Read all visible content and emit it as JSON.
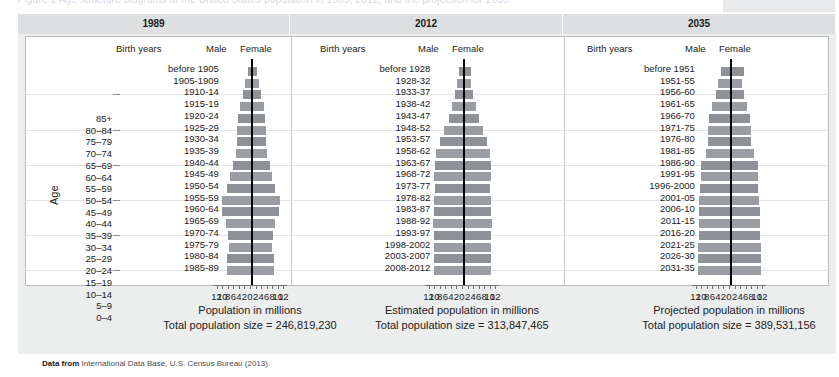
{
  "top_strip": {
    "faded_caption": "Figure 1  Age structure diagrams of the United States population in 1989, 2012, and the projection for 2035."
  },
  "figure": {
    "y_axis_label": "Age",
    "age_groups": [
      "85+",
      "80–84",
      "75–79",
      "70–74",
      "65–69",
      "60–64",
      "55–59",
      "50–54",
      "45–49",
      "40–44",
      "35–39",
      "30–34",
      "25–29",
      "20–24",
      "15–19",
      "10–14",
      "5–9",
      "0–4"
    ],
    "column_headers": {
      "birth_years": "Birth years",
      "male": "Male",
      "female": "Female"
    },
    "x_tick_labels": [
      "12",
      "10",
      "8",
      "6",
      "4",
      "2",
      "0",
      "2",
      "4",
      "6",
      "8",
      "10",
      "12"
    ],
    "source_prefix": "Data from",
    "source_text": "International Data Base, U.S. Census Bureau (2013)."
  },
  "panels": [
    {
      "year": "1989",
      "axis_title": "Population in millions",
      "total_label": "Total population size = 246,819,230",
      "birth_years": [
        "before 1905",
        "1905–1909",
        "1910–14",
        "1915–19",
        "1920–24",
        "1925–29",
        "1930–34",
        "1935–39",
        "1940–44",
        "1945–49",
        "1950–54",
        "1955–59",
        "1960–64",
        "1965–69",
        "1970–74",
        "1975–79",
        "1980–84",
        "1985–89"
      ]
    },
    {
      "year": "2012",
      "axis_title": "Estimated population in millions",
      "total_label": "Total population size = 313,847,465",
      "birth_years": [
        "before 1928",
        "1928–32",
        "1933–37",
        "1938–42",
        "1943–47",
        "1948–52",
        "1953–57",
        "1958–62",
        "1963–67",
        "1968–72",
        "1973–77",
        "1978–82",
        "1983–87",
        "1988–92",
        "1993–97",
        "1998–2002",
        "2003–2007",
        "2008–2012"
      ]
    },
    {
      "year": "2035",
      "axis_title": "Projected population in millions",
      "total_label": "Total population size = 389,531,156",
      "birth_years": [
        "before 1951",
        "1951–55",
        "1956–60",
        "1961–65",
        "1966–70",
        "1971–75",
        "1976–80",
        "1981–85",
        "1986–90",
        "1991–95",
        "1996–2000",
        "2001–05",
        "2006–10",
        "2011–15",
        "2016–20",
        "2021–25",
        "2026–30",
        "2031–35"
      ]
    }
  ],
  "colors": {
    "bar": "#8e9196",
    "bar_alt": "#9a9da2",
    "centerline": "#000000",
    "plate": "#eceded",
    "header_band": "#dedfe1",
    "axis": "#6f7479"
  },
  "chart_data": {
    "type": "bar",
    "xlabel": "Population in millions",
    "ylabel": "Age",
    "xlim": [
      -12,
      12
    ],
    "grid": true,
    "legend_position": "top-inside",
    "orientation": "horizontal-diverging",
    "note": "Population pyramids. Male values plotted leftward, Female values rightward. Units: millions of people. Values estimated from axis ticks (2-million gridline spacing).",
    "categories": [
      "85+",
      "80-84",
      "75-79",
      "70-74",
      "65-69",
      "60-64",
      "55-59",
      "50-54",
      "45-49",
      "40-44",
      "35-39",
      "30-34",
      "25-29",
      "20-24",
      "15-19",
      "10-14",
      "5-9",
      "0-4"
    ],
    "panels": [
      {
        "name": "1989",
        "total_population": 246819230,
        "total_population_label": "Total population size = 246,819,230",
        "birth_years": [
          "before 1905",
          "1905-1909",
          "1910-14",
          "1915-19",
          "1920-24",
          "1925-29",
          "1930-34",
          "1935-39",
          "1940-44",
          "1945-49",
          "1950-54",
          "1955-59",
          "1960-64",
          "1965-69",
          "1970-74",
          "1975-79",
          "1980-84",
          "1985-89"
        ],
        "series": [
          {
            "name": "Male",
            "values": [
              1.1,
              2.0,
              2.8,
              3.8,
              4.6,
              5.0,
              4.9,
              5.4,
              6.5,
              7.5,
              8.7,
              10.5,
              10.3,
              9.0,
              8.3,
              7.9,
              8.5,
              8.8
            ]
          },
          {
            "name": "Female",
            "values": [
              2.0,
              2.8,
              3.6,
              4.6,
              5.2,
              5.5,
              5.4,
              5.7,
              6.7,
              7.5,
              8.6,
              10.4,
              10.2,
              8.8,
              8.0,
              7.5,
              8.1,
              8.4
            ]
          }
        ]
      },
      {
        "name": "2012",
        "total_population": 313847465,
        "total_population_label": "Total population size = 313,847,465",
        "birth_years": [
          "before 1928",
          "1928-32",
          "1933-37",
          "1938-42",
          "1943-47",
          "1948-52",
          "1953-57",
          "1958-62",
          "1963-67",
          "1968-72",
          "1973-77",
          "1978-82",
          "1983-87",
          "1988-92",
          "1993-97",
          "1998-2002",
          "2003-2007",
          "2008-2012"
        ],
        "series": [
          {
            "name": "Male",
            "values": [
              1.5,
              2.1,
              2.8,
              4.0,
              5.2,
              6.8,
              8.3,
              9.7,
              10.2,
              10.4,
              10.0,
              10.3,
              10.4,
              10.7,
              10.4,
              10.4,
              10.4,
              10.4
            ]
          },
          {
            "name": "Female",
            "values": [
              2.8,
              3.0,
              3.6,
              4.8,
              5.8,
              7.2,
              8.5,
              9.8,
              10.2,
              10.2,
              9.8,
              10.1,
              10.1,
              10.4,
              10.1,
              10.1,
              10.0,
              10.0
            ]
          }
        ]
      },
      {
        "name": "2035",
        "total_population": 389531156,
        "total_population_label": "Total population size = 389,531,156",
        "birth_years": [
          "before 1951",
          "1951-55",
          "1956-60",
          "1961-65",
          "1966-70",
          "1971-75",
          "1976-80",
          "1981-85",
          "1986-90",
          "1991-95",
          "1996-2000",
          "2001-05",
          "2006-10",
          "2011-15",
          "2016-20",
          "2021-25",
          "2026-30",
          "2031-35"
        ],
        "series": [
          {
            "name": "Male",
            "values": [
              3.4,
              4.2,
              5.2,
              6.4,
              7.5,
              7.8,
              7.9,
              8.8,
              10.6,
              10.4,
              10.9,
              11.1,
              11.1,
              11.1,
              11.2,
              11.6,
              11.6,
              11.6
            ]
          },
          {
            "name": "Female",
            "values": [
              5.0,
              4.2,
              5.2,
              6.2,
              7.2,
              7.5,
              7.6,
              8.6,
              10.1,
              10.1,
              10.0,
              10.6,
              10.7,
              10.7,
              10.8,
              11.2,
              11.2,
              11.2
            ]
          }
        ]
      }
    ]
  }
}
